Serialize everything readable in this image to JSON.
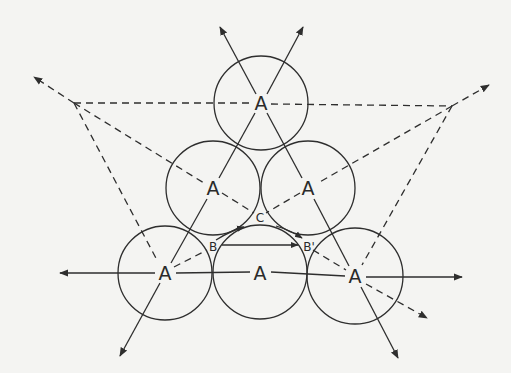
{
  "figure": {
    "colors": {
      "background": "#f4f4f2",
      "stroke": "#2e2e2e"
    },
    "labels": {
      "atom": "A",
      "site_b": "B",
      "site_b_prime": "B'",
      "site_c": "C"
    },
    "atoms": [
      {
        "id": "top",
        "label": "A",
        "cx": 261,
        "cy": 103,
        "r": 47
      },
      {
        "id": "mid-left",
        "label": "A",
        "cx": 213,
        "cy": 188,
        "r": 47
      },
      {
        "id": "mid-right",
        "label": "A",
        "cx": 308,
        "cy": 188,
        "r": 47
      },
      {
        "id": "bottom-left",
        "label": "A",
        "cx": 165,
        "cy": 273,
        "r": 47
      },
      {
        "id": "bottom-middle",
        "label": "A",
        "cx": 260,
        "cy": 272,
        "r": 47
      },
      {
        "id": "bottom-right",
        "label": "A",
        "cx": 355,
        "cy": 276,
        "r": 48
      }
    ],
    "sites": [
      {
        "id": "B",
        "label": "B",
        "x": 213,
        "y": 246
      },
      {
        "id": "B-prime",
        "label": "B'",
        "x": 307,
        "y": 246
      },
      {
        "id": "C",
        "label": "C",
        "x": 260,
        "y": 217
      }
    ],
    "dashed_triangle": {
      "vertices": [
        [
          74,
          103
        ],
        [
          452,
          106
        ],
        [
          165,
          273
        ]
      ]
    }
  }
}
